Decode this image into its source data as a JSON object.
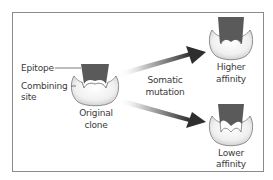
{
  "diagram": {
    "labels": {
      "epitope": "Epitope",
      "combining_site_line1": "Combining",
      "combining_site_line2": "site",
      "original_clone_line1": "Original",
      "original_clone_line2": "clone",
      "somatic_mutation_line1": "Somatic",
      "somatic_mutation_line2": "mutation",
      "higher_affinity_line1": "Higher",
      "higher_affinity_line2": "affinity",
      "lower_affinity_line1": "Lower",
      "lower_affinity_line2": "affinity"
    },
    "colors": {
      "epitope": "#5a5a5a",
      "antibody_fill": "#eaeaea",
      "arrow_head": "#333333",
      "frame": "#8a8a8a"
    }
  }
}
